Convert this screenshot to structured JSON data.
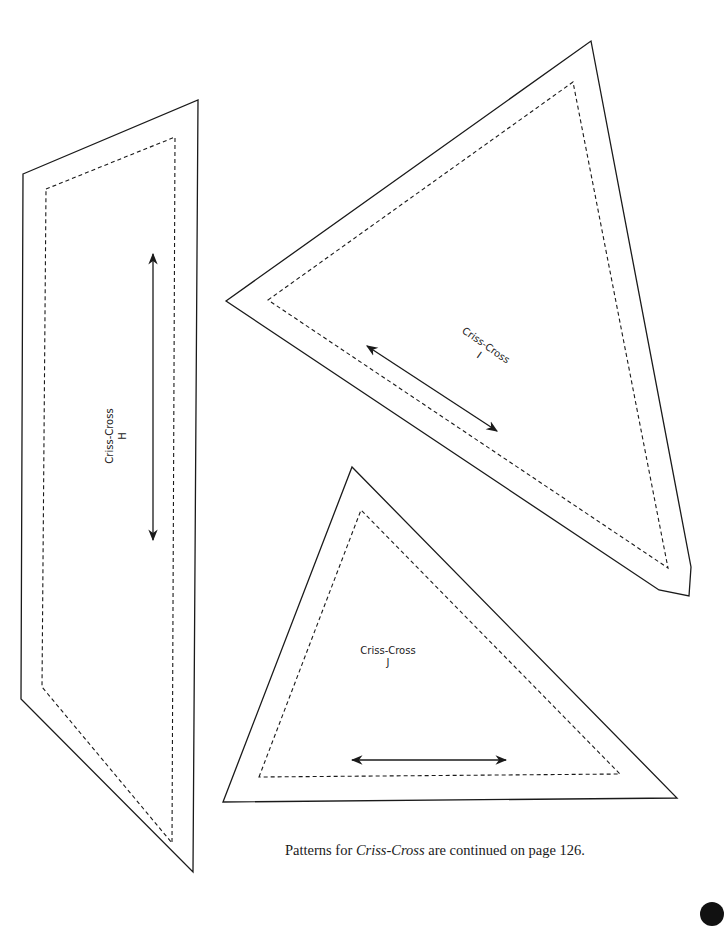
{
  "pieces": [
    {
      "id": "H",
      "label_line1": "Criss-Cross",
      "label_line2": "H",
      "orientation": "rotated -90deg",
      "outline_points": "23,174 198,100 193,872 21,699",
      "seam_points": "46,189 175,137 172,843 42,687",
      "grainline": {
        "x1": 153,
        "y1": 254,
        "x2": 153,
        "y2": 540
      },
      "label_pos": {
        "x": 116,
        "y": 436
      }
    },
    {
      "id": "I",
      "label_line1": "Criss-Cross",
      "label_line2": "I",
      "orientation": "rotated 35deg",
      "outline_points": "226,301 591,41 691,567 689,596 659,590",
      "seam_points": "268,300 573,82 668,568",
      "grainline": {
        "x1": 367,
        "y1": 346,
        "x2": 497,
        "y2": 431
      },
      "label_pos": {
        "x": 484,
        "y": 348
      }
    },
    {
      "id": "J",
      "label_line1": "Criss-Cross",
      "label_line2": "J",
      "orientation": "horizontal",
      "outline_points": "223,802 352,467 677,798",
      "seam_points": "259,777 361,510 620,774",
      "grainline": {
        "x1": 352,
        "y1": 760,
        "x2": 506,
        "y2": 760
      },
      "label_pos": {
        "x": 388,
        "y": 654
      }
    }
  ],
  "footer": {
    "prefix": "Patterns for ",
    "italic": "Criss-Cross",
    "suffix": " are continued on page 126."
  },
  "colors": {
    "ink": "#1a1a1a",
    "background": "#ffffff"
  }
}
